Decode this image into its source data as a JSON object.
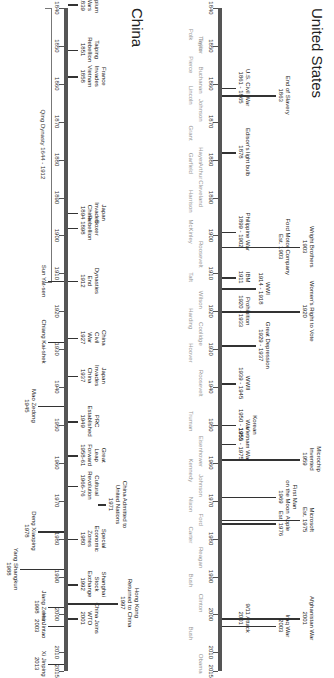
{
  "layout": {
    "year_start": 1840,
    "year_end": 2015,
    "x0": 8,
    "px_per_year": 3.79
  },
  "us": {
    "title": "United States",
    "axis_years": [
      "1840",
      "1850",
      "1860",
      "1870",
      "1880",
      "1890",
      "1900",
      "1910",
      "1920",
      "1930",
      "1940",
      "1950",
      "1960",
      "1970",
      "1980",
      "1990",
      "2000",
      "2010",
      "2015"
    ],
    "presidents": [
      {
        "name": "Taylor",
        "year": 1849.5
      },
      {
        "name": "Polk",
        "year": 1847
      },
      {
        "name": "Taylor",
        "year": 1850
      },
      {
        "name": "Pierce",
        "year": 1855
      },
      {
        "name": "Buchanan",
        "year": 1859
      },
      {
        "name": "Lincoln",
        "year": 1863
      },
      {
        "name": "Johnson",
        "year": 1867
      },
      {
        "name": "Grant",
        "year": 1873
      },
      {
        "name": "Hayes",
        "year": 1879
      },
      {
        "name": "Garfield",
        "year": 1881
      },
      {
        "name": "Arthur",
        "year": 1883
      },
      {
        "name": "Harrison",
        "year": 1891
      },
      {
        "name": "Cleveland",
        "year": 1889
      },
      {
        "name": "McKinley",
        "year": 1899
      },
      {
        "name": "Roosevelt",
        "year": 1905
      },
      {
        "name": "Taft",
        "year": 1911
      },
      {
        "name": "Wilson",
        "year": 1917
      },
      {
        "name": "Harding",
        "year": 1922
      },
      {
        "name": "Coolidge",
        "year": 1926
      },
      {
        "name": "Hoover",
        "year": 1931
      },
      {
        "name": "Roosevelt",
        "year": 1939
      },
      {
        "name": "Truman",
        "year": 1949
      },
      {
        "name": "Eisenhower",
        "year": 1957
      },
      {
        "name": "Kennedy",
        "year": 1962
      },
      {
        "name": "Johnson",
        "year": 1966
      },
      {
        "name": "Nixon",
        "year": 1971
      },
      {
        "name": "Ford",
        "year": 1975
      },
      {
        "name": "Carter",
        "year": 1979
      },
      {
        "name": "Reagan",
        "year": 1985
      },
      {
        "name": "Bush",
        "year": 1991
      },
      {
        "name": "Clinton",
        "year": 1997
      },
      {
        "name": "Bush",
        "year": 2005
      },
      {
        "name": "Obama",
        "year": 2013
      }
    ],
    "events": [
      {
        "text": "U.S. Civil War\n1861 - 1865",
        "year": 1861,
        "level": 1
      },
      {
        "text": "End of Slavery\n1863",
        "year": 1863,
        "level": 3
      },
      {
        "text": "Edison's light bulb\n1878",
        "year": 1878,
        "level": 1
      },
      {
        "text": "Philippine War\n1899 - 1902",
        "year": 1899,
        "level": 1
      },
      {
        "text": "Ford Motor Company\nEst. 1903",
        "year": 1903,
        "level": 3
      },
      {
        "text": "Wright Brothers\n1903",
        "year": 1903,
        "level": 4
      },
      {
        "text": "IBM\n1911",
        "year": 1911,
        "level": 1
      },
      {
        "text": "WWI\n1914 - 1918",
        "year": 1914,
        "level": 2
      },
      {
        "text": "Women's Right to Vote\n1920",
        "year": 1920,
        "level": 4
      },
      {
        "text": "Prohibition\n1920 - 1933",
        "year": 1920,
        "level": 1
      },
      {
        "text": "Great Depression\n1929 - 1937",
        "year": 1929,
        "level": 2
      },
      {
        "text": "WWII\n1939 - 1945",
        "year": 1939,
        "level": 1
      },
      {
        "text": "Korean\nWar\n1950 - 1953",
        "year": 1950,
        "level": 1
      },
      {
        "text": "Microchip\nInvented\n1959",
        "year": 1959,
        "level": 4
      },
      {
        "text": "First Man\non the Moon\n1969",
        "year": 1969,
        "level": 3
      },
      {
        "text": "Vietnam War\n1955 - 1975",
        "year": 1955,
        "level": 1
      },
      {
        "text": "Microsoft\nEst. 1975",
        "year": 1975,
        "level": 4
      },
      {
        "text": "Apple\nEst. 1976",
        "year": 1976,
        "level": 3
      },
      {
        "text": "9/11 Attack\n2001",
        "year": 2001,
        "level": 1
      },
      {
        "text": "Afghanistan War\n2001",
        "year": 2001,
        "level": 4
      },
      {
        "text": "Iraq War\n2003",
        "year": 2003,
        "level": 3
      }
    ]
  },
  "china": {
    "title": "China",
    "axis_years": [
      "1840",
      "1850",
      "1860",
      "1870",
      "1880",
      "1890",
      "1900",
      "1910",
      "1920",
      "1930",
      "1940",
      "1950",
      "1960",
      "1970",
      "1980",
      "1990",
      "2000",
      "2010",
      "2015"
    ],
    "dynasty": {
      "label": "Qing Dynasty 1644 - 1912",
      "from": 1840,
      "to": 1912
    },
    "events": [
      {
        "text": "Opium\nWars\n1839",
        "year": 1839
      },
      {
        "text": "Taiping\nRebellion\n1851",
        "year": 1851
      },
      {
        "text": "France\nInvades\nVietnam\n1858",
        "year": 1858
      },
      {
        "text": "Japan\nInvades\nChina\n1894",
        "year": 1894
      },
      {
        "text": "Boxer\nRebellion\n1898",
        "year": 1898
      },
      {
        "text": "Dynasties\nEnd\n1912",
        "year": 1912
      },
      {
        "text": "China\nCivil\nWar\n1927",
        "year": 1927
      },
      {
        "text": "Japan\nInvades\nChina\n1937",
        "year": 1937
      },
      {
        "text": "PRC\nEstablished\n1949",
        "year": 1949
      },
      {
        "text": "Great\nLeap\nForward\n1958-61",
        "year": 1958
      },
      {
        "text": "Cultural\nRevolution\n1966-76",
        "year": 1966
      },
      {
        "text": "Special\nEconomic\nZones\n1980",
        "year": 1980
      },
      {
        "text": "Shanghai\nStock\nExchange\n1992",
        "year": 1992
      },
      {
        "text": "China Joins\nWTO\n2001",
        "year": 2001
      }
    ],
    "far_events": [
      {
        "text": "China Admitted to\nUnited Nations\n1971",
        "year": 1971
      },
      {
        "text": "Hong Kong\nReturned to China\n1997",
        "year": 1997
      }
    ],
    "leaders": [
      {
        "text": "Sun Yat-sen",
        "year": 1912,
        "level": 0
      },
      {
        "text": "Chiang Kai-shek",
        "year": 1928,
        "level": 0
      },
      {
        "text": "Mao Zedong\n1945",
        "year": 1945,
        "level": 1
      },
      {
        "text": "Deng Xiaoping\n1978",
        "year": 1978,
        "level": 1
      },
      {
        "text": "Yang Shangkun\n1988",
        "year": 1988,
        "level": 2
      },
      {
        "text": "Jiang Zemin\n1998",
        "year": 1998,
        "level": 0
      },
      {
        "text": "Hu Jintao\n2003",
        "year": 2003,
        "level": 0
      },
      {
        "text": "Xi Jinping\n2013",
        "year": 2013,
        "level": 0
      }
    ]
  }
}
